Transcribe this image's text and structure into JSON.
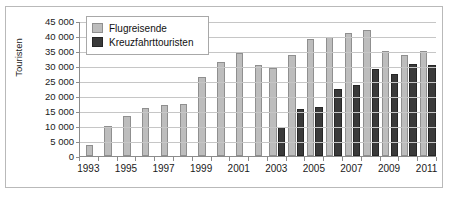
{
  "chart_data": {
    "type": "bar",
    "title": "",
    "subtitle": "",
    "xlabel": "",
    "ylabel": "Touristen",
    "ylim": [
      0,
      45000
    ],
    "ytick_values": [
      0,
      5000,
      10000,
      15000,
      20000,
      25000,
      30000,
      35000,
      40000,
      45000
    ],
    "ytick_labels": [
      "0",
      "5 000",
      "10 000",
      "15 000",
      "20 000",
      "25 000",
      "30 000",
      "35 000",
      "40 000",
      "45 000"
    ],
    "grid": true,
    "legend_position": "top-left",
    "categories": [
      1993,
      1994,
      1995,
      1996,
      1997,
      1998,
      1999,
      2000,
      2001,
      2002,
      2003,
      2004,
      2005,
      2006,
      2007,
      2008,
      2009,
      2010,
      2011
    ],
    "xtick_labels": [
      "1993",
      "",
      "1995",
      "",
      "1997",
      "",
      "1999",
      "",
      "2001",
      "",
      "2003",
      "",
      "2005",
      "",
      "2007",
      "",
      "2009",
      "",
      "2011"
    ],
    "series": [
      {
        "name": "Flugreisende",
        "color": "#bdbdbd",
        "values": [
          3800,
          10000,
          13300,
          15900,
          17000,
          17200,
          26500,
          31500,
          34200,
          30500,
          29400,
          33600,
          39000,
          39600,
          41100,
          42000,
          35000,
          33800,
          35000
        ]
      },
      {
        "name": "Kreuzfahrttouristen",
        "color": "#3a3a3a",
        "values": [
          null,
          null,
          null,
          null,
          null,
          null,
          null,
          null,
          null,
          null,
          9800,
          15800,
          16500,
          22200,
          23700,
          29100,
          27200,
          30600,
          30200
        ]
      }
    ]
  },
  "legend": {
    "items": [
      {
        "label": "Flugreisende",
        "swatch": "air"
      },
      {
        "label": "Kreuzfahrttouristen",
        "swatch": "cruise"
      }
    ]
  },
  "axis": {
    "y_title": "Touristen"
  }
}
